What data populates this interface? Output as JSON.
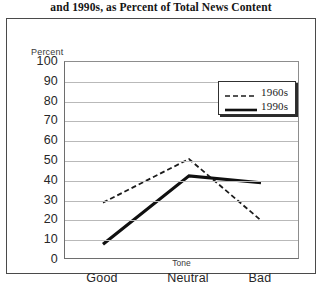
{
  "caption": "and 1990s, as Percent of Total News Content",
  "axes": {
    "y_title": "Percent",
    "x_title": "Tone",
    "y_ticks": [
      "100",
      "90",
      "80",
      "70",
      "60",
      "50",
      "40",
      "30",
      "20",
      "10",
      "0"
    ],
    "x_ticks": [
      "Good",
      "Neutral",
      "Bad"
    ]
  },
  "legend": {
    "items": [
      {
        "label": "1960s",
        "style": "dashed",
        "color": "#1b1b1b"
      },
      {
        "label": "1990s",
        "style": "solid",
        "color": "#101010"
      }
    ]
  },
  "chart_data": {
    "type": "line",
    "title": "and 1990s, as Percent of Total News Content",
    "xlabel": "Tone",
    "ylabel": "Percent",
    "categories": [
      "Good",
      "Neutral",
      "Bad"
    ],
    "ylim": [
      0,
      100
    ],
    "ytick_step": 10,
    "grid": true,
    "legend_position": "top-right-inside",
    "series": [
      {
        "name": "1960s",
        "values": [
          29,
          51,
          20
        ],
        "style": "dashed",
        "color": "#1b1b1b",
        "width": 1.8
      },
      {
        "name": "1990s",
        "values": [
          8,
          42.5,
          39
        ],
        "style": "solid",
        "color": "#101010",
        "width": 3.2
      }
    ]
  }
}
